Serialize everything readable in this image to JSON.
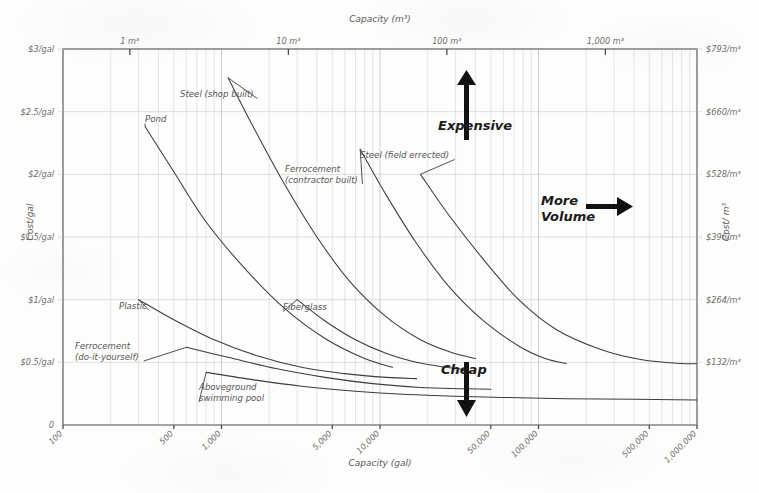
{
  "chart_data": {
    "type": "line",
    "title": "",
    "xlabel": "Capacity (gal)",
    "ylabel": "Cost/gal",
    "xlabel_top": "Capacity (m³)",
    "ylabel_right": "Cost/ m³",
    "xscale": "log",
    "xlim": [
      100,
      1000000
    ],
    "ylim": [
      0,
      3
    ],
    "grid": true,
    "legend_position": "inline-labels",
    "x_ticks": [
      {
        "value": 100,
        "label": "100"
      },
      {
        "value": 500,
        "label": "500"
      },
      {
        "value": 1000,
        "label": "1,000"
      },
      {
        "value": 5000,
        "label": "5,000"
      },
      {
        "value": 10000,
        "label": "10,000"
      },
      {
        "value": 50000,
        "label": "50,000"
      },
      {
        "value": 100000,
        "label": "100,000"
      },
      {
        "value": 500000,
        "label": "500,000"
      },
      {
        "value": 1000000,
        "label": "1,000,000"
      }
    ],
    "x_ticks_top": [
      {
        "value": 264,
        "label": "1 m³"
      },
      {
        "value": 2642,
        "label": "10 m³"
      },
      {
        "value": 26420,
        "label": "100 m³"
      },
      {
        "value": 264200,
        "label": "1,000 m³"
      }
    ],
    "y_ticks": [
      {
        "value": 3,
        "label": "$3/gal"
      },
      {
        "value": 2.5,
        "label": "$2.5/gal"
      },
      {
        "value": 2,
        "label": "$2/gal"
      },
      {
        "value": 1.5,
        "label": "$1.5/gal"
      },
      {
        "value": 1,
        "label": "$1/gal"
      },
      {
        "value": 0.5,
        "label": "$0.5/gal"
      },
      {
        "value": 0,
        "label": "0"
      }
    ],
    "y_ticks_right": [
      {
        "value": 3,
        "label": "$793/m³"
      },
      {
        "value": 2.5,
        "label": "$660/m³"
      },
      {
        "value": 2,
        "label": "$528/m³"
      },
      {
        "value": 1.5,
        "label": "$396/m³"
      },
      {
        "value": 1,
        "label": "$264/m³"
      },
      {
        "value": 0.5,
        "label": "$132/m³"
      }
    ],
    "series": [
      {
        "name": "Pond",
        "label": "Pond",
        "label_x": 145,
        "label_y": 122,
        "points": [
          [
            330,
            2.38
          ],
          [
            500,
            2.02
          ],
          [
            800,
            1.62
          ],
          [
            1400,
            1.25
          ],
          [
            2500,
            0.93
          ],
          [
            4500,
            0.69
          ],
          [
            8000,
            0.53
          ],
          [
            12000,
            0.46
          ]
        ]
      },
      {
        "name": "Steel (shop built)",
        "label": "Steel (shop built)",
        "label_x": 180,
        "label_y": 97,
        "points": [
          [
            1100,
            2.77
          ],
          [
            1600,
            2.37
          ],
          [
            2500,
            1.92
          ],
          [
            4000,
            1.5
          ],
          [
            6500,
            1.14
          ],
          [
            11000,
            0.86
          ],
          [
            18000,
            0.68
          ],
          [
            28000,
            0.58
          ],
          [
            40000,
            0.53
          ]
        ]
      },
      {
        "name": "Ferrocement (contractor built)",
        "label": "Ferrocement\n(contractor built)",
        "label_x": 285,
        "label_y": 172,
        "points": [
          [
            7500,
            2.2
          ],
          [
            11000,
            1.83
          ],
          [
            17000,
            1.45
          ],
          [
            27000,
            1.11
          ],
          [
            45000,
            0.83
          ],
          [
            75000,
            0.63
          ],
          [
            110000,
            0.53
          ],
          [
            150000,
            0.49
          ]
        ]
      },
      {
        "name": "Steel (field errected)",
        "label": "Steel (field errected)",
        "label_x": 360,
        "label_y": 158,
        "points": [
          [
            18000,
            2.0
          ],
          [
            27000,
            1.68
          ],
          [
            45000,
            1.32
          ],
          [
            75000,
            1.0
          ],
          [
            130000,
            0.76
          ],
          [
            250000,
            0.6
          ],
          [
            450000,
            0.52
          ],
          [
            800000,
            0.49
          ],
          [
            1000000,
            0.49
          ]
        ]
      },
      {
        "name": "Fiberglass",
        "label": "Fiberglass",
        "label_x": 283,
        "label_y": 310,
        "points": [
          [
            3000,
            1.0
          ],
          [
            4500,
            0.83
          ],
          [
            7000,
            0.68
          ],
          [
            11000,
            0.57
          ],
          [
            17000,
            0.5
          ],
          [
            26000,
            0.46
          ],
          [
            36000,
            0.44
          ]
        ]
      },
      {
        "name": "Plastic",
        "label": "Plastic",
        "label_x": 119,
        "label_y": 309,
        "points": [
          [
            300,
            1.0
          ],
          [
            500,
            0.84
          ],
          [
            900,
            0.68
          ],
          [
            1700,
            0.55
          ],
          [
            3200,
            0.46
          ],
          [
            6000,
            0.41
          ],
          [
            11000,
            0.38
          ],
          [
            17000,
            0.37
          ]
        ]
      },
      {
        "name": "Ferrocement (do-it-yourself)",
        "label": "Ferrocement\n(do-it-yourself)",
        "label_x": 75,
        "label_y": 349,
        "points": [
          [
            600,
            0.62
          ],
          [
            1100,
            0.54
          ],
          [
            2200,
            0.45
          ],
          [
            4500,
            0.38
          ],
          [
            9000,
            0.33
          ],
          [
            18000,
            0.3
          ],
          [
            32000,
            0.29
          ],
          [
            50000,
            0.285
          ]
        ]
      },
      {
        "name": "Aboveground swimming pool",
        "label": "Aboveground\nswimming pool",
        "label_x": 199,
        "label_y": 390,
        "points": [
          [
            800,
            0.42
          ],
          [
            1600,
            0.36
          ],
          [
            3200,
            0.31
          ],
          [
            7000,
            0.27
          ],
          [
            14000,
            0.245
          ],
          [
            30000,
            0.23
          ],
          [
            60000,
            0.22
          ],
          [
            150000,
            0.21
          ],
          [
            400000,
            0.205
          ],
          [
            1000000,
            0.2
          ]
        ]
      }
    ],
    "annotations": [
      {
        "name": "expensive",
        "text": "Expensive",
        "direction": "up"
      },
      {
        "name": "more-volume",
        "text": "More\nVolume",
        "direction": "right"
      },
      {
        "name": "cheap",
        "text": "Cheap",
        "direction": "down"
      }
    ],
    "annotation_expensive_line1": "Expensive",
    "annotation_morevolume_line1": "More",
    "annotation_morevolume_line2": "Volume",
    "annotation_cheap_line1": "Cheap"
  }
}
